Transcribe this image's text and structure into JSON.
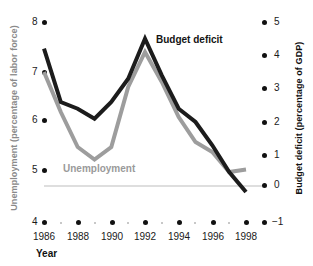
{
  "chart_data": {
    "type": "line",
    "title": "",
    "xlabel": "Year",
    "x": [
      1986,
      1987,
      1988,
      1989,
      1990,
      1991,
      1992,
      1993,
      1994,
      1995,
      1996,
      1997,
      1998
    ],
    "xticks": [
      "1986",
      "1988",
      "1990",
      "1992",
      "1994",
      "1996",
      "1998"
    ],
    "xlim": [
      1985.5,
      1998.8
    ],
    "grid": false,
    "zero_line": true,
    "legend": "inline-labels",
    "axes": [
      {
        "side": "left",
        "label": "Unemployment (percentage of labor force)",
        "ticks": [
          "8",
          "7",
          "6",
          "5",
          "4"
        ],
        "tick_values": [
          8,
          7,
          6,
          5,
          4
        ],
        "ylim": [
          4,
          8
        ],
        "color": "#8a8a8a"
      },
      {
        "side": "right",
        "label": "Budget deficit (percentage of GDP)",
        "ticks": [
          "5",
          "4",
          "3",
          "2",
          "1",
          "0",
          "−1"
        ],
        "tick_values": [
          5,
          4,
          3,
          2,
          1,
          0,
          -1
        ],
        "ylim": [
          -1,
          5
        ],
        "color": "#111111"
      }
    ],
    "series": [
      {
        "name": "Budget deficit",
        "axis": "right",
        "color": "#1c1c1c",
        "values": [
          4.2,
          2.6,
          2.4,
          2.1,
          2.6,
          3.3,
          4.5,
          3.4,
          2.4,
          2.0,
          1.3,
          0.5,
          -0.1
        ]
      },
      {
        "name": "Unemployment",
        "axis": "left",
        "color": "#9d9d9d",
        "values": [
          7.0,
          6.2,
          5.5,
          5.25,
          5.5,
          6.7,
          7.4,
          6.8,
          6.1,
          5.6,
          5.4,
          5.0,
          5.05
        ]
      }
    ],
    "annotations": [
      {
        "text": "Budget deficit",
        "color": "#141414"
      },
      {
        "text": "Unemployment",
        "color": "#9a9a9a"
      }
    ]
  },
  "labels": {
    "left_axis_title": "Unemployment (percentage of labor force)",
    "right_axis_title": "Budget deficit (percentage of GDP)",
    "x_axis_title": "Year",
    "series_budget": "Budget deficit",
    "series_unemployment": "Unemployment"
  },
  "left_ticks": [
    {
      "label": "8"
    },
    {
      "label": "7"
    },
    {
      "label": "6"
    },
    {
      "label": "5"
    },
    {
      "label": "4"
    }
  ],
  "right_ticks": [
    {
      "label": "5"
    },
    {
      "label": "4"
    },
    {
      "label": "3"
    },
    {
      "label": "2"
    },
    {
      "label": "1"
    },
    {
      "label": "0"
    },
    {
      "label": "−1"
    }
  ],
  "x_ticks": [
    {
      "label": "1986"
    },
    {
      "label": "1988"
    },
    {
      "label": "1990"
    },
    {
      "label": "1992"
    },
    {
      "label": "1994"
    },
    {
      "label": "1996"
    },
    {
      "label": "1998"
    }
  ],
  "colors": {
    "budget_deficit": "#1c1c1c",
    "unemployment": "#9d9d9d",
    "zero_line": "#bdbdbd",
    "tick_dot": "#111111",
    "minor_dot": "#b6b6b6"
  }
}
